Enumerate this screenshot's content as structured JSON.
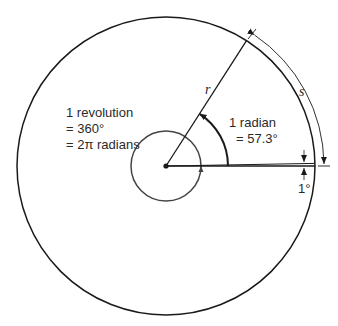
{
  "diagram": {
    "type": "radian-definition",
    "colors": {
      "stroke": "#1a1a1a",
      "text": "#2a2a2a",
      "background": "#ffffff"
    },
    "labels": {
      "radius": "r",
      "arc_length": "s",
      "revolution_line1": "1 revolution",
      "revolution_line2": "= 360°",
      "revolution_line3": "= 2π radians",
      "radian_line1": "1 radian",
      "radian_line2": "= 57.3°",
      "degree": "1°"
    },
    "geometry": {
      "center": [
        166,
        166
      ],
      "outer_radius": 149,
      "inner_radius": 35,
      "radian_angle_deg": 57.3,
      "degree_angle_deg": 1
    }
  }
}
